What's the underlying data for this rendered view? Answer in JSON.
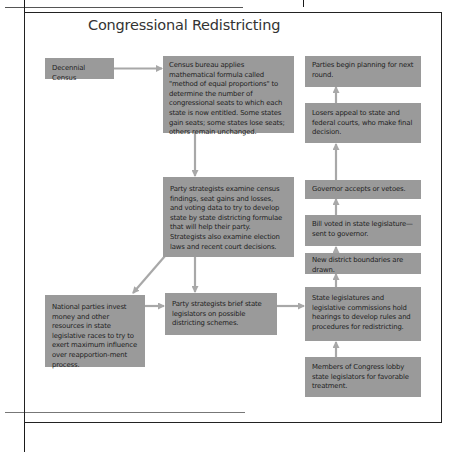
{
  "header": {
    "partial_title": "Process Box 10.1",
    "title": "Congressional Redistricting"
  },
  "colors": {
    "box_fill": "#9a9a9a",
    "arrow": "#a8a8a8",
    "frame": "#222222",
    "text": "#1e1e1e"
  },
  "flowchart": {
    "nodes": {
      "decennial_census": "Decennial Census",
      "census_bureau": "Census bureau applies mathematical formula called \"method of equal proportions\" to determine the number of congressional seats to which each state is now entitled. Some states gain seats; some states lose seats; others remain unchanged.",
      "party_strategists_examine": "Party strategists examine census findings, seat gains and losses, and voting data to try to develop state by state districting formulae that will help their party. Strategists also examine election laws and recent court decisions.",
      "national_parties": "National parties invest money and other resources in state legislative races to try to exert maximum influence over reapportion-ment process.",
      "party_strategists_brief": "Party  strategists brief state legislators on possible districting schemes.",
      "parties_begin": "Parties begin planning for next round.",
      "losers_appeal": "Losers appeal to state and federal courts, who make final decision.",
      "governor": "Governor accepts or vetoes.",
      "bill_voted": "Bill voted in state legislature—sent to governor.",
      "new_district": "New district boundaries are drawn.",
      "state_legislatures": "State legislatures and legislative commissions hold hearings to develop rules and procedures for redistricting.",
      "members_of_congress": "Members of Congress lobby state legislators for favorable treatment."
    },
    "edges": [
      [
        "decennial_census",
        "census_bureau"
      ],
      [
        "census_bureau",
        "party_strategists_examine"
      ],
      [
        "party_strategists_examine",
        "national_parties"
      ],
      [
        "party_strategists_examine",
        "party_strategists_brief"
      ],
      [
        "national_parties",
        "party_strategists_brief"
      ],
      [
        "party_strategists_brief",
        "state_legislatures"
      ],
      [
        "members_of_congress",
        "state_legislatures"
      ],
      [
        "state_legislatures",
        "new_district"
      ],
      [
        "new_district",
        "bill_voted"
      ],
      [
        "bill_voted",
        "governor"
      ],
      [
        "governor",
        "losers_appeal"
      ],
      [
        "losers_appeal",
        "parties_begin"
      ]
    ]
  }
}
